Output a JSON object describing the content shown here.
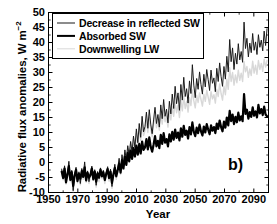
{
  "chart_data": {
    "type": "line",
    "title": "",
    "panel_label": "b)",
    "xlabel": "Year",
    "ylabel": "Radiative flux anomalies, W m−2",
    "xlim": [
      1950,
      2100
    ],
    "ylim": [
      -10,
      50
    ],
    "xticks": [
      1950,
      1970,
      1990,
      2010,
      2030,
      2050,
      2070,
      2090
    ],
    "yticks": [
      -10,
      -5,
      0,
      5,
      10,
      15,
      20,
      25,
      30,
      35,
      40,
      45,
      50
    ],
    "ytick_labels": [
      "-10",
      "-5",
      "0",
      "5",
      "10",
      "15",
      "20",
      "25",
      "30",
      "35",
      "40",
      "45",
      "50"
    ],
    "xtick_labels": [
      "1950",
      "1970",
      "1990",
      "2010",
      "2030",
      "2050",
      "2070",
      "2090"
    ],
    "grid": false,
    "legend_position": "upper-left",
    "minor_ticks": true,
    "x_start": 1959,
    "x_end": 2099,
    "series": [
      {
        "name": "Decrease in reflected SW",
        "color": "#1a1a1a",
        "width": 1.0,
        "values": [
          -2.2,
          -4.6,
          -1.1,
          -6.0,
          -3.4,
          0.4,
          -5.2,
          -2.6,
          -9.4,
          -3.8,
          -1.6,
          -5.8,
          -3.1,
          -7.0,
          -2.0,
          -4.4,
          0.2,
          -5.6,
          -2.8,
          -6.4,
          -3.6,
          -1.2,
          -4.8,
          -2.4,
          -7.6,
          -3.0,
          -5.4,
          -1.8,
          -4.2,
          -2.6,
          -6.2,
          -3.4,
          -1.4,
          -5.0,
          -2.2,
          -8.0,
          -3.8,
          -0.6,
          -4.4,
          -2.0,
          1.4,
          -3.2,
          2.6,
          -1.0,
          4.2,
          0.8,
          5.6,
          2.2,
          7.0,
          3.4,
          8.8,
          5.0,
          11.2,
          6.6,
          13.0,
          8.4,
          15.4,
          10.2,
          12.0,
          16.8,
          11.4,
          17.6,
          12.8,
          9.6,
          14.2,
          18.4,
          13.0,
          16.0,
          11.8,
          19.2,
          14.6,
          21.0,
          15.4,
          17.8,
          13.2,
          20.4,
          16.2,
          22.8,
          18.0,
          25.4,
          19.6,
          23.2,
          17.4,
          26.0,
          20.8,
          28.4,
          22.0,
          24.6,
          19.8,
          27.2,
          23.0,
          32.6,
          25.8,
          21.6,
          28.0,
          24.4,
          30.2,
          26.0,
          22.8,
          29.4,
          25.2,
          31.0,
          27.6,
          24.0,
          30.8,
          26.4,
          28.2,
          23.6,
          31.4,
          27.0,
          33.2,
          28.6,
          25.4,
          32.0,
          27.8,
          35.4,
          30.2,
          41.0,
          33.6,
          38.2,
          31.0,
          36.4,
          32.8,
          39.6,
          34.2,
          37.0,
          33.4,
          46.8,
          38.0,
          41.4,
          35.2,
          39.8,
          36.6,
          43.0,
          37.4,
          40.2,
          36.0,
          42.6,
          38.4,
          40.8,
          37.2,
          43.8,
          39.0,
          44.6
        ]
      },
      {
        "name": "Absorbed SW",
        "color": "#000000",
        "width": 2.2,
        "values": [
          -3.0,
          -5.2,
          -2.0,
          -6.6,
          -4.0,
          -1.2,
          -5.8,
          -3.2,
          -7.8,
          -4.4,
          -2.4,
          -6.2,
          -3.8,
          -5.4,
          -2.8,
          -4.8,
          -1.6,
          -6.0,
          -3.4,
          -5.0,
          -4.2,
          -2.0,
          -5.6,
          -3.0,
          -6.4,
          -3.6,
          -5.0,
          -2.4,
          -4.6,
          -3.2,
          -5.8,
          -3.8,
          -2.2,
          -5.2,
          -3.0,
          -6.8,
          -4.0,
          -1.8,
          -4.6,
          -2.6,
          -0.4,
          -3.4,
          0.8,
          -2.0,
          2.0,
          -0.8,
          3.2,
          0.4,
          4.0,
          1.2,
          4.8,
          2.0,
          5.6,
          2.6,
          6.2,
          3.0,
          7.0,
          4.2,
          5.0,
          7.8,
          4.4,
          8.4,
          5.2,
          3.6,
          6.0,
          8.8,
          5.4,
          7.2,
          4.8,
          9.2,
          6.2,
          9.8,
          6.6,
          7.8,
          5.4,
          9.4,
          7.0,
          10.2,
          7.6,
          11.0,
          8.2,
          10.0,
          7.4,
          11.4,
          8.6,
          12.2,
          9.2,
          10.6,
          8.0,
          11.8,
          9.4,
          13.4,
          10.2,
          8.8,
          11.6,
          9.8,
          12.6,
          10.4,
          9.0,
          12.0,
          10.0,
          12.8,
          11.0,
          9.4,
          12.4,
          10.6,
          11.8,
          9.8,
          13.0,
          11.2,
          14.0,
          11.8,
          10.4,
          13.6,
          11.6,
          15.0,
          12.4,
          17.2,
          13.8,
          16.0,
          12.8,
          15.2,
          13.4,
          16.6,
          14.0,
          15.4,
          13.8,
          22.8,
          16.2,
          17.6,
          14.6,
          16.8,
          15.2,
          18.4,
          15.6,
          17.0,
          15.0,
          19.2,
          16.4,
          17.8,
          15.8,
          18.6,
          16.0,
          15.4
        ]
      },
      {
        "name": "Downwelling LW",
        "color": "#d8d8d8",
        "width": 1.4,
        "values": [
          -3.4,
          -5.8,
          -2.6,
          -7.2,
          -4.6,
          -2.0,
          -6.4,
          -3.8,
          -9.8,
          -5.0,
          -3.0,
          -6.8,
          -4.2,
          -7.4,
          -3.4,
          -5.6,
          -1.8,
          -6.6,
          -4.0,
          -7.0,
          -4.6,
          -2.4,
          -6.0,
          -3.6,
          -8.2,
          -4.2,
          -6.4,
          -3.0,
          -5.4,
          -3.8,
          -7.0,
          -4.4,
          -2.6,
          -6.2,
          -3.4,
          -8.6,
          -4.8,
          -2.2,
          -5.6,
          -3.2,
          0.6,
          -4.0,
          1.8,
          -2.2,
          3.4,
          0.2,
          4.8,
          1.6,
          6.2,
          2.8,
          7.8,
          4.2,
          9.8,
          5.8,
          11.4,
          7.4,
          13.2,
          9.0,
          10.6,
          14.2,
          10.0,
          15.0,
          11.2,
          8.6,
          12.6,
          15.6,
          11.6,
          14.0,
          10.8,
          16.2,
          12.8,
          17.4,
          13.6,
          15.4,
          11.8,
          17.0,
          14.2,
          18.6,
          15.4,
          20.2,
          16.6,
          19.0,
          15.0,
          20.8,
          17.2,
          22.0,
          18.0,
          20.4,
          16.8,
          21.6,
          19.0,
          24.2,
          20.6,
          18.2,
          22.4,
          20.0,
          23.2,
          21.0,
          18.8,
          22.8,
          20.4,
          24.0,
          21.8,
          19.4,
          23.6,
          21.2,
          22.6,
          19.8,
          24.4,
          22.0,
          26.2,
          23.0,
          20.8,
          25.4,
          22.6,
          27.8,
          24.4,
          31.6,
          27.0,
          30.0,
          25.8,
          29.2,
          26.6,
          30.8,
          27.4,
          29.8,
          27.0,
          33.6,
          30.2,
          32.0,
          28.4,
          31.2,
          29.0,
          33.8,
          29.8,
          32.4,
          29.4,
          34.0,
          31.0,
          33.0,
          30.4,
          34.4,
          31.8,
          34.0
        ]
      }
    ]
  },
  "legend": {
    "entries": [
      {
        "label": "Decrease in reflected SW",
        "style": "lw-thin"
      },
      {
        "label": "Absorbed SW",
        "style": "lw-thick"
      },
      {
        "label": "Downwelling LW",
        "style": "lw-light"
      }
    ]
  }
}
